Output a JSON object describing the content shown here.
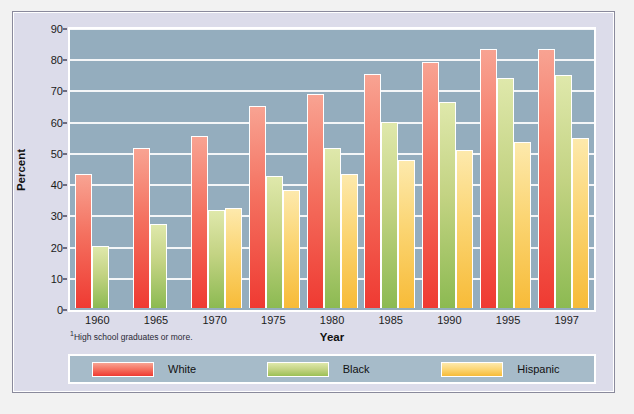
{
  "chart_data": {
    "type": "bar",
    "title": "",
    "xlabel": "Year",
    "ylabel": "Percent",
    "ylim": [
      0,
      90
    ],
    "yticks": [
      0,
      10,
      20,
      30,
      40,
      50,
      60,
      70,
      80,
      90
    ],
    "grid": true,
    "legend_position": "bottom",
    "footnote": "High school graduates or more.",
    "footnote_marker": "1",
    "categories": [
      "1960",
      "1965",
      "1970",
      "1975",
      "1980",
      "1985",
      "1990",
      "1995",
      "1997"
    ],
    "series": [
      {
        "name": "White",
        "color": "#f4705f",
        "values": [
          43.2,
          51.3,
          55.4,
          65.0,
          68.8,
          75.0,
          79.0,
          83.0,
          83.0
        ]
      },
      {
        "name": "Black",
        "color": "#a8c768",
        "values": [
          20.1,
          27.2,
          31.4,
          42.5,
          51.4,
          59.8,
          66.2,
          73.8,
          74.9
        ]
      },
      {
        "name": "Hispanic",
        "color": "#f8cc5e",
        "values": [
          null,
          null,
          32.1,
          37.9,
          43.0,
          47.5,
          50.8,
          53.4,
          54.7
        ]
      }
    ]
  },
  "legend": {
    "items": [
      {
        "label": "White"
      },
      {
        "label": "Black"
      },
      {
        "label": "Hispanic"
      }
    ]
  },
  "colors": {
    "plot_background": "#94adbe",
    "panel_background": "#dcdcea",
    "gridline": "#f4f6f8",
    "legend_background": "#a6bbc9"
  }
}
